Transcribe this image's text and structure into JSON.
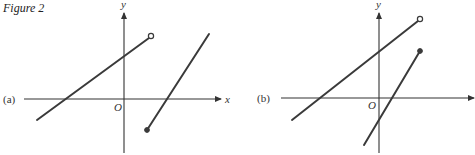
{
  "figure": {
    "caption": "Figure 2",
    "panels": [
      {
        "id": "a",
        "label": "(a)",
        "x_axis_label": "x",
        "y_axis_label": "y",
        "origin_label": "O",
        "segments": [
          {
            "name": "left-piece",
            "from": [
              37,
              120
            ],
            "to": [
              151,
              36
            ],
            "end_marker": "open",
            "y_intercept_above_origin": true
          },
          {
            "name": "right-piece",
            "from": [
              147,
              130
            ],
            "to": [
              209,
              34
            ],
            "start_marker": "closed"
          }
        ]
      },
      {
        "id": "b",
        "label": "(b)",
        "x_axis_label": "",
        "y_axis_label": "y",
        "origin_label": "O",
        "segments": [
          {
            "name": "left-piece",
            "from": [
              292,
              120
            ],
            "to": [
              420,
              19
            ],
            "end_marker": "open"
          },
          {
            "name": "right-piece",
            "from": [
              420,
              51
            ],
            "to": [
              364,
              145
            ],
            "start_marker": "closed"
          }
        ]
      }
    ]
  },
  "colors": {
    "ink": "#3a3a3a",
    "background": "#ffffff"
  }
}
